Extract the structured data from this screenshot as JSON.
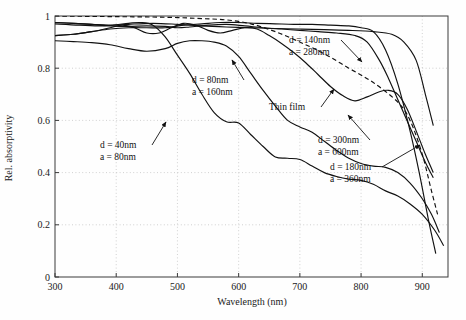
{
  "figure": {
    "background": "#fefefe",
    "frame_color": "#3a3a3a",
    "grid_color": "#bdbdbd",
    "curve_color": "#111111"
  },
  "chart_data": {
    "type": "line",
    "title": "",
    "xlabel": "Wavelength (nm)",
    "ylabel": "Rel. absorptivity",
    "xlim": [
      300,
      942
    ],
    "ylim": [
      0,
      1
    ],
    "xticks": [
      300,
      400,
      500,
      600,
      700,
      800,
      900
    ],
    "yticks": [
      0,
      0.2,
      0.4,
      0.6,
      0.8,
      1
    ],
    "xticklabels": [
      "300",
      "400",
      "500",
      "600",
      "700",
      "800",
      "900"
    ],
    "yticklabels": [
      "0",
      "0.2",
      "0.4",
      "0.6",
      "0.8",
      "1"
    ],
    "grid": true,
    "grid_style": "dotted",
    "legend": "none (inline annotated labels with arrows)",
    "series": [
      {
        "name": "Thin film",
        "style": "dashed",
        "label": "Thin film",
        "x": [
          300,
          340,
          380,
          420,
          460,
          500,
          540,
          580,
          620,
          660,
          700,
          740,
          780,
          820,
          860,
          880,
          900,
          915,
          925
        ],
        "y": [
          1.0,
          0.999,
          0.998,
          0.997,
          0.996,
          0.994,
          0.99,
          0.985,
          0.97,
          0.94,
          0.9,
          0.855,
          0.8,
          0.745,
          0.67,
          0.6,
          0.47,
          0.33,
          0.24
        ]
      },
      {
        "name": "d = 40nm, a = 80nm",
        "style": "solid",
        "label_d": "d = 40nm",
        "label_a": "a = 80nm",
        "x": [
          300,
          330,
          360,
          390,
          420,
          440,
          460,
          480,
          500,
          520,
          540,
          560,
          580,
          600,
          620,
          640,
          660,
          680,
          700,
          720,
          740,
          760,
          780,
          800,
          820,
          840,
          860,
          880,
          900,
          920,
          935
        ],
        "y": [
          0.975,
          0.972,
          0.968,
          0.965,
          0.972,
          0.975,
          0.965,
          0.92,
          0.85,
          0.78,
          0.7,
          0.63,
          0.595,
          0.59,
          0.545,
          0.5,
          0.46,
          0.455,
          0.45,
          0.425,
          0.4,
          0.385,
          0.375,
          0.37,
          0.355,
          0.33,
          0.31,
          0.28,
          0.24,
          0.18,
          0.12
        ]
      },
      {
        "name": "d = 80nm, a = 160nm",
        "style": "solid",
        "label_d": "d = 80nm",
        "label_a": "a = 160nm",
        "x": [
          300,
          330,
          360,
          390,
          420,
          450,
          480,
          500,
          520,
          540,
          560,
          580,
          600,
          620,
          640,
          660,
          680,
          700,
          720,
          740,
          760,
          780,
          800,
          820,
          840,
          860,
          880,
          900,
          915,
          928
        ],
        "y": [
          0.905,
          0.902,
          0.898,
          0.89,
          0.875,
          0.865,
          0.875,
          0.895,
          0.905,
          0.905,
          0.9,
          0.885,
          0.845,
          0.78,
          0.715,
          0.655,
          0.6,
          0.575,
          0.555,
          0.52,
          0.485,
          0.455,
          0.435,
          0.425,
          0.42,
          0.4,
          0.36,
          0.3,
          0.24,
          0.17
        ]
      },
      {
        "name": "d = 140nm, a = 280nm",
        "style": "solid",
        "label_d": "d = 140nm",
        "label_a": "a = 280nm",
        "x": [
          300,
          330,
          360,
          390,
          420,
          450,
          480,
          510,
          540,
          570,
          600,
          630,
          660,
          690,
          720,
          750,
          780,
          800,
          820,
          840,
          860,
          880,
          895,
          910,
          922
        ],
        "y": [
          0.925,
          0.93,
          0.94,
          0.95,
          0.955,
          0.955,
          0.955,
          0.965,
          0.97,
          0.975,
          0.975,
          0.972,
          0.97,
          0.968,
          0.968,
          0.965,
          0.962,
          0.955,
          0.94,
          0.87,
          0.74,
          0.56,
          0.4,
          0.22,
          0.09
        ]
      },
      {
        "name": "d = 180nm, a = 360nm",
        "style": "solid",
        "label_d": "d = 180nm",
        "label_a": "a = 360nm",
        "x": [
          300,
          330,
          360,
          390,
          420,
          450,
          480,
          500,
          520,
          550,
          580,
          610,
          640,
          670,
          700,
          730,
          760,
          790,
          810,
          830,
          845,
          860,
          875,
          890,
          905,
          918
        ],
        "y": [
          0.975,
          0.972,
          0.968,
          0.962,
          0.96,
          0.962,
          0.96,
          0.955,
          0.958,
          0.965,
          0.968,
          0.962,
          0.955,
          0.95,
          0.945,
          0.94,
          0.935,
          0.925,
          0.9,
          0.83,
          0.76,
          0.68,
          0.6,
          0.52,
          0.44,
          0.38
        ]
      },
      {
        "name": "d = 300nm, a = 600nm",
        "style": "solid",
        "label_d": "d = 300nm",
        "label_a": "a = 600nm",
        "x": [
          300,
          330,
          360,
          390,
          410,
          430,
          450,
          470,
          490,
          510,
          530,
          550,
          570,
          590,
          610,
          630,
          650,
          670,
          690,
          710,
          730,
          750,
          770,
          790,
          810,
          830,
          845,
          860,
          875,
          890,
          905,
          918
        ],
        "y": [
          0.925,
          0.93,
          0.94,
          0.955,
          0.965,
          0.955,
          0.935,
          0.935,
          0.955,
          0.972,
          0.965,
          0.945,
          0.935,
          0.945,
          0.955,
          0.95,
          0.925,
          0.895,
          0.86,
          0.82,
          0.775,
          0.73,
          0.695,
          0.675,
          0.69,
          0.71,
          0.715,
          0.7,
          0.645,
          0.56,
          0.47,
          0.4
        ]
      },
      {
        "name": "upper-plateau curve",
        "style": "solid",
        "x": [
          300,
          340,
          380,
          420,
          460,
          500,
          540,
          580,
          620,
          660,
          700,
          740,
          780,
          820,
          850,
          870,
          890,
          905,
          918
        ],
        "y": [
          0.97,
          0.965,
          0.962,
          0.968,
          0.972,
          0.968,
          0.962,
          0.958,
          0.955,
          0.952,
          0.95,
          0.948,
          0.945,
          0.94,
          0.93,
          0.9,
          0.83,
          0.7,
          0.58
        ]
      }
    ],
    "annotations": [
      {
        "name": "annotation-d40",
        "lines": [
          "d = 40nm",
          "a = 80nm"
        ],
        "x": 100,
        "y": 148,
        "arrow_to": [
          166,
          122
        ]
      },
      {
        "name": "annotation-d80",
        "lines": [
          "d = 80nm",
          "a = 160nm"
        ],
        "x": 192,
        "y": 83,
        "arrow_to": [
          232,
          60
        ]
      },
      {
        "name": "annotation-d140",
        "lines": [
          "d = 140nm",
          "a = 280nm"
        ],
        "x": 289,
        "y": 43,
        "arrow_to": [
          362,
          62
        ]
      },
      {
        "name": "annotation-thinfilm",
        "lines": [
          "Thin film"
        ],
        "x": 269,
        "y": 110,
        "arrow_to": [
          334,
          89
        ]
      },
      {
        "name": "annotation-d300",
        "lines": [
          "d = 300nm",
          "a = 600nm"
        ],
        "x": 318,
        "y": 143,
        "arrow_to": [
          348,
          115
        ]
      },
      {
        "name": "annotation-d180",
        "lines": [
          "d = 180nm",
          "a = 360nm"
        ],
        "x": 330,
        "y": 170,
        "arrow_to": [
          420,
          145
        ]
      }
    ]
  }
}
